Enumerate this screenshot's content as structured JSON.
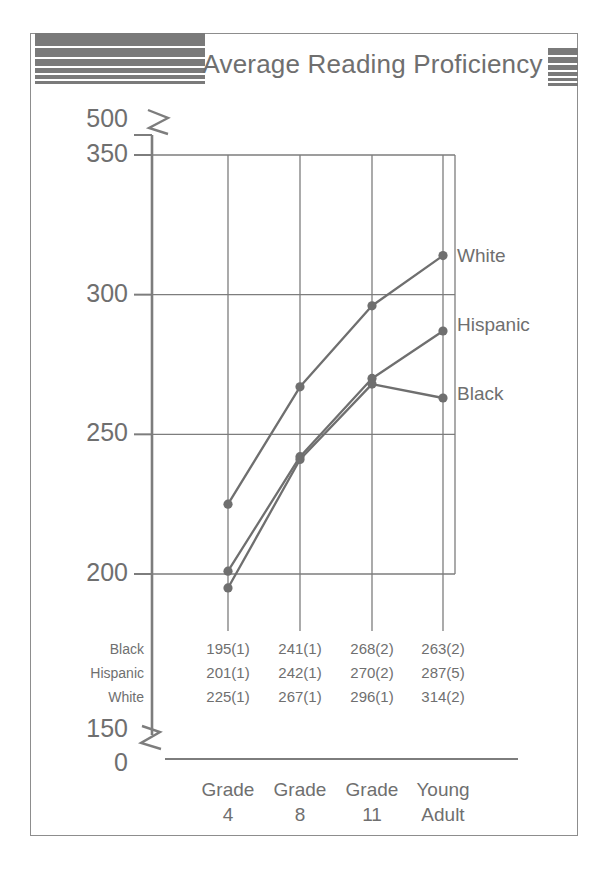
{
  "header": {
    "title": "Average Reading Proficiency",
    "left_stripes": 6,
    "right_stripes": 5,
    "bar_color": "#7a7a7a"
  },
  "chart_data": {
    "type": "line",
    "title": "Average Reading Proficiency",
    "xlabel": "",
    "ylabel": "",
    "categories": [
      "Grade 4",
      "Grade 8",
      "Grade 11",
      "Young Adult"
    ],
    "category_lines": [
      [
        "Grade",
        "4"
      ],
      [
        "Grade",
        "8"
      ],
      [
        "Grade",
        "11"
      ],
      [
        "Young",
        "Adult"
      ]
    ],
    "ylim": [
      150,
      350
    ],
    "yticks": [
      "500",
      "350",
      "300",
      "250",
      "200",
      "150",
      "0"
    ],
    "grid_yticks": [
      350,
      300,
      250,
      200
    ],
    "axis_breaks": [
      "between 500 and 350",
      "between 150 and 0"
    ],
    "grid": true,
    "legend_position": "right-inline",
    "series": [
      {
        "name": "White",
        "values": [
          225,
          267,
          296,
          314
        ],
        "errors": [
          1,
          1,
          1,
          2
        ],
        "color": "#6f6f6f"
      },
      {
        "name": "Hispanic",
        "values": [
          201,
          242,
          270,
          287
        ],
        "errors": [
          1,
          1,
          2,
          5
        ],
        "color": "#6f6f6f"
      },
      {
        "name": "Black",
        "values": [
          195,
          241,
          268,
          263
        ],
        "errors": [
          1,
          1,
          2,
          2
        ],
        "color": "#6f6f6f"
      }
    ],
    "table": {
      "row_labels": [
        "Black",
        "Hispanic",
        "White"
      ],
      "rows": [
        [
          "195(1)",
          "241(1)",
          "268(2)",
          "263(2)"
        ],
        [
          "201(1)",
          "242(1)",
          "270(2)",
          "287(5)"
        ],
        [
          "225(1)",
          "267(1)",
          "296(1)",
          "314(2)"
        ]
      ]
    },
    "series_labels": [
      "White",
      "Hispanic",
      "Black"
    ]
  },
  "axis": {
    "t500": "500",
    "t350": "350",
    "t300": "300",
    "t250": "250",
    "t200": "200",
    "t150": "150",
    "t0": "0"
  }
}
